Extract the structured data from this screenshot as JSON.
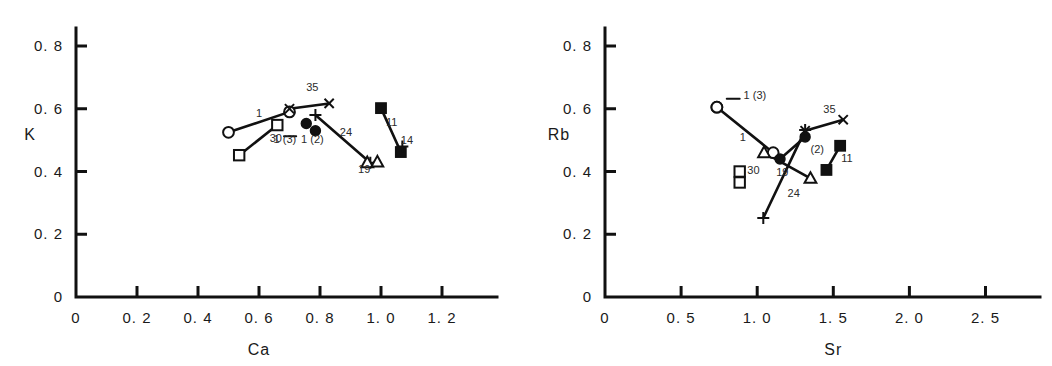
{
  "figure": {
    "panels": [
      "left",
      "right"
    ],
    "background": "#ffffff",
    "ink_color": "#111111"
  },
  "chart_data": [
    {
      "id": "left",
      "type": "scatter",
      "title": "",
      "xlabel": "Ca",
      "ylabel": "K",
      "xlim": [
        0,
        1.35
      ],
      "ylim": [
        0,
        0.86
      ],
      "xticks": [
        0,
        0.2,
        0.4,
        0.6,
        0.8,
        1.0,
        1.2
      ],
      "xticklabels": [
        "0",
        "0. 2",
        "0. 4",
        "0. 6",
        "0. 8",
        "1. 0",
        "1. 2"
      ],
      "yticks": [
        0,
        0.2,
        0.4,
        0.6,
        0.8
      ],
      "yticklabels": [
        "0",
        "0. 2",
        "0. 4",
        "0. 6",
        "0. 8"
      ],
      "grid": false,
      "legend": "none",
      "series": [
        {
          "name": "1",
          "label": "1",
          "label_x": 0.6,
          "label_y": 0.575,
          "marker": "open-circle",
          "connect": true,
          "points": [
            {
              "x": 0.5,
              "y": 0.525
            },
            {
              "x": 0.7,
              "y": 0.59
            }
          ]
        },
        {
          "name": "30",
          "label": "30",
          "label_x": 0.655,
          "label_y": 0.493,
          "marker": "open-square",
          "connect": true,
          "points": [
            {
              "x": 0.535,
              "y": 0.452
            },
            {
              "x": 0.66,
              "y": 0.548
            }
          ]
        },
        {
          "name": "35",
          "label": "35",
          "label_x": 0.775,
          "label_y": 0.655,
          "marker": "x-cross",
          "connect": true,
          "points": [
            {
              "x": 0.7,
              "y": 0.6
            },
            {
              "x": 0.83,
              "y": 0.617
            }
          ]
        },
        {
          "name": "1(3)",
          "label": "1 (3)",
          "label_x": 0.685,
          "label_y": 0.492,
          "marker": "filled-circle",
          "connect": false,
          "points": [
            {
              "x": 0.755,
              "y": 0.553
            }
          ]
        },
        {
          "name": "1(2)",
          "label": "1 (2)",
          "label_x": 0.775,
          "label_y": 0.492,
          "marker": "filled-circle",
          "connect": false,
          "points": [
            {
              "x": 0.785,
              "y": 0.53
            }
          ]
        },
        {
          "name": "24",
          "label": "24",
          "label_x": 0.885,
          "label_y": 0.512,
          "marker": "plus-cross",
          "connect": true,
          "points": [
            {
              "x": 0.785,
              "y": 0.58
            },
            {
              "x": 0.965,
              "y": 0.428
            }
          ]
        },
        {
          "name": "19",
          "label": "19",
          "label_x": 0.945,
          "label_y": 0.395,
          "marker": "open-triangle",
          "connect": false,
          "points": [
            {
              "x": 0.955,
              "y": 0.428
            },
            {
              "x": 0.988,
              "y": 0.43
            }
          ]
        },
        {
          "name": "11",
          "label": "11",
          "label_x": 1.035,
          "label_y": 0.545,
          "marker": "filled-square",
          "connect": true,
          "points": [
            {
              "x": 1.0,
              "y": 0.602
            },
            {
              "x": 1.065,
              "y": 0.462
            }
          ]
        },
        {
          "name": "14",
          "label": "14",
          "label_x": 1.085,
          "label_y": 0.487,
          "marker": "plus-cross",
          "connect": false,
          "points": [
            {
              "x": 1.07,
              "y": 0.48
            }
          ]
        }
      ]
    },
    {
      "id": "right",
      "type": "scatter",
      "title": "",
      "xlabel": "Sr",
      "ylabel": "Rb",
      "xlim": [
        0,
        2.8
      ],
      "ylim": [
        0,
        0.86
      ],
      "xticks": [
        0,
        0.5,
        1.0,
        1.5,
        2.0,
        2.5
      ],
      "xticklabels": [
        "0",
        "0. 5",
        "1. 0",
        "1. 5",
        "2. 0",
        "2. 5"
      ],
      "yticks": [
        0,
        0.2,
        0.4,
        0.6,
        0.8
      ],
      "yticklabels": [
        "0",
        "0. 2",
        "0. 4",
        "0. 6",
        "0. 8"
      ],
      "grid": false,
      "legend": "none",
      "series": [
        {
          "name": "1(3)",
          "label": "1 (3)",
          "label_x": 0.985,
          "label_y": 0.632,
          "marker": "open-circle",
          "connect": false,
          "points": [
            {
              "x": 0.735,
              "y": 0.605
            }
          ]
        },
        {
          "name": "1",
          "label": "1",
          "label_x": 0.905,
          "label_y": 0.498,
          "marker": "open-circle",
          "connect": true,
          "points": [
            {
              "x": 0.735,
              "y": 0.605
            },
            {
              "x": 1.105,
              "y": 0.46
            }
          ]
        },
        {
          "name": "30",
          "label": "30",
          "label_x": 0.975,
          "label_y": 0.392,
          "marker": "open-square",
          "connect": false,
          "points": [
            {
              "x": 0.885,
              "y": 0.4
            },
            {
              "x": 0.885,
              "y": 0.365
            }
          ]
        },
        {
          "name": "(2)",
          "label": "(2)",
          "label_x": 1.395,
          "label_y": 0.46,
          "marker": "filled-circle",
          "connect": true,
          "points": [
            {
              "x": 1.15,
              "y": 0.44
            },
            {
              "x": 1.315,
              "y": 0.51
            }
          ]
        },
        {
          "name": "35",
          "label": "35",
          "label_x": 1.475,
          "label_y": 0.585,
          "marker": "x-cross",
          "connect": true,
          "points": [
            {
              "x": 1.315,
              "y": 0.53
            },
            {
              "x": 1.565,
              "y": 0.565
            }
          ]
        },
        {
          "name": "19",
          "label": "19",
          "label_x": 1.165,
          "label_y": 0.385,
          "marker": "open-triangle",
          "connect": true,
          "points": [
            {
              "x": 1.045,
              "y": 0.46
            },
            {
              "x": 1.35,
              "y": 0.378
            }
          ]
        },
        {
          "name": "24",
          "label": "24",
          "label_x": 1.24,
          "label_y": 0.318,
          "marker": "plus-cross",
          "connect": true,
          "points": [
            {
              "x": 1.04,
              "y": 0.252
            },
            {
              "x": 1.315,
              "y": 0.532
            }
          ]
        },
        {
          "name": "11",
          "label": "11",
          "label_x": 1.59,
          "label_y": 0.43,
          "marker": "filled-square",
          "connect": true,
          "points": [
            {
              "x": 1.455,
              "y": 0.405
            },
            {
              "x": 1.545,
              "y": 0.482
            }
          ]
        }
      ]
    }
  ]
}
